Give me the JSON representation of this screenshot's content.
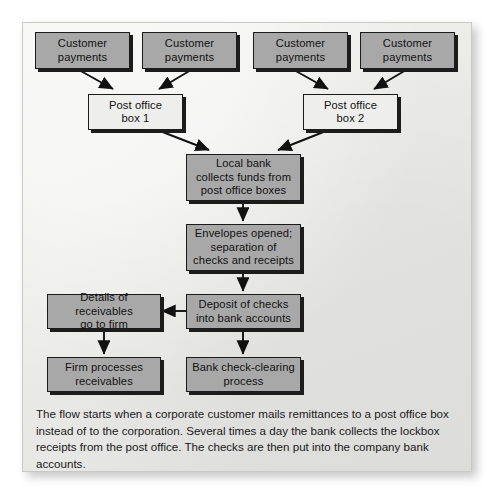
{
  "diagram": {
    "nodes": [
      {
        "id": "cust1",
        "label_line1": "Customer",
        "label_line2": "payments",
        "style": "gray"
      },
      {
        "id": "cust2",
        "label_line1": "Customer",
        "label_line2": "payments",
        "style": "gray"
      },
      {
        "id": "cust3",
        "label_line1": "Customer",
        "label_line2": "payments",
        "style": "gray"
      },
      {
        "id": "cust4",
        "label_line1": "Customer",
        "label_line2": "payments",
        "style": "gray"
      },
      {
        "id": "pobox1",
        "label_line1": "Post office",
        "label_line2": "box 1",
        "style": "light"
      },
      {
        "id": "pobox2",
        "label_line1": "Post office",
        "label_line2": "box 2",
        "style": "light"
      },
      {
        "id": "localbank",
        "label_line1": "Local bank",
        "label_line2": "collects funds from",
        "label_line3": "post office boxes",
        "style": "gray"
      },
      {
        "id": "envelopes",
        "label_line1": "Envelopes opened;",
        "label_line2": "separation of",
        "label_line3": "checks and receipts",
        "style": "gray"
      },
      {
        "id": "deposit",
        "label_line1": "Deposit of checks",
        "label_line2": "into bank accounts",
        "style": "gray"
      },
      {
        "id": "details",
        "label_line1": "Details of receivables",
        "label_line2": "go to firm",
        "style": "gray"
      },
      {
        "id": "firm",
        "label_line1": "Firm processes",
        "label_line2": "receivables",
        "style": "gray"
      },
      {
        "id": "checkclearing",
        "label_line1": "Bank check-clearing",
        "label_line2": "process",
        "style": "gray"
      }
    ],
    "edges": [
      {
        "from": "cust1",
        "to": "pobox1"
      },
      {
        "from": "cust2",
        "to": "pobox1"
      },
      {
        "from": "cust3",
        "to": "pobox2"
      },
      {
        "from": "cust4",
        "to": "pobox2"
      },
      {
        "from": "pobox1",
        "to": "localbank"
      },
      {
        "from": "pobox2",
        "to": "localbank"
      },
      {
        "from": "localbank",
        "to": "envelopes"
      },
      {
        "from": "envelopes",
        "to": "deposit"
      },
      {
        "from": "deposit",
        "to": "details"
      },
      {
        "from": "deposit",
        "to": "checkclearing"
      },
      {
        "from": "details",
        "to": "firm"
      }
    ],
    "colors": {
      "panel_background": "#e9e9e7",
      "node_gray": "#a8a8a8",
      "node_light": "#eeeeec",
      "node_border": "#1b1b1b",
      "arrow": "#111111",
      "text": "#111111"
    }
  },
  "caption": {
    "text": "The flow starts when a corporate customer mails remittances to a post office box instead of to the corporation. Several times a day the bank collects the lockbox receipts from the post office. The checks are then put into the company bank accounts."
  }
}
